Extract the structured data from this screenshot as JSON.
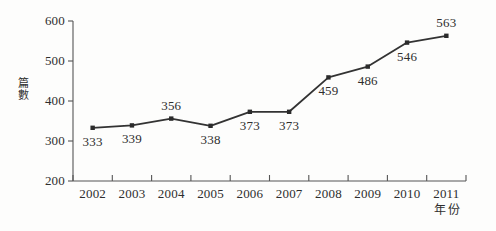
{
  "chart_data": {
    "type": "line",
    "title": "",
    "xlabel": "年份",
    "ylabel": "篇數",
    "categories": [
      "2002",
      "2003",
      "2004",
      "2005",
      "2006",
      "2007",
      "2008",
      "2009",
      "2010",
      "2011"
    ],
    "values": [
      333,
      339,
      356,
      338,
      373,
      373,
      459,
      486,
      546,
      563
    ],
    "point_labels": [
      "333",
      "339",
      "356",
      "338",
      "373",
      "373",
      "459",
      "486",
      "546",
      "563"
    ],
    "label_positions": [
      "below",
      "below",
      "above",
      "below",
      "below",
      "below",
      "below",
      "below",
      "below",
      "above"
    ],
    "ylim": [
      200,
      600
    ],
    "y_ticks": [
      "200",
      "300",
      "400",
      "500",
      "600"
    ],
    "y_tick_values": [
      200,
      300,
      400,
      500,
      600
    ],
    "grid": false,
    "legend": "none",
    "series_name": "篇數",
    "marker": "square",
    "line_color": "#333333",
    "marker_color": "#2b2b2b",
    "background_color": "#fdfdfc",
    "axis_color": "#555555"
  }
}
